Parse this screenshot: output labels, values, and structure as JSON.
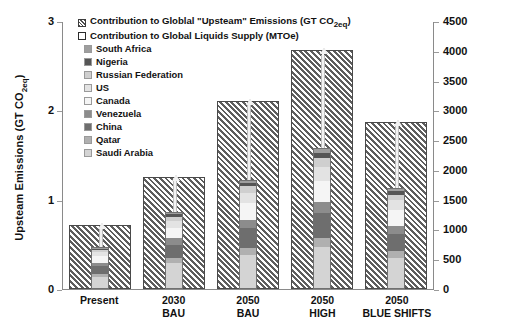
{
  "chart_data": {
    "type": "bar",
    "title": "",
    "subtitle": "",
    "categories": [
      "Present",
      "2030 BAU",
      "2050 BAU",
      "2050 HIGH",
      "2050 BLUE SHIFTS"
    ],
    "category_lines": [
      {
        "line1": "Present",
        "line2": ""
      },
      {
        "line1": "2030",
        "line2": "BAU"
      },
      {
        "line1": "2050",
        "line2": "BAU"
      },
      {
        "line1": "2050",
        "line2": "HIGH"
      },
      {
        "line1": "2050",
        "line2": "BLUE SHIFTS"
      }
    ],
    "xlabel": "",
    "ylabel": "Upsteam Emissions (GT CO2eq)",
    "ylabel_right": "Liquids Supply (MTOe)",
    "ylim": [
      0,
      3
    ],
    "ylim_right": [
      0,
      4500
    ],
    "yticks": [
      0,
      1,
      2,
      3
    ],
    "yticks_right": [
      0,
      500,
      1000,
      1500,
      2000,
      2500,
      3000,
      3500,
      4000,
      4500
    ],
    "grid": false,
    "legend_position": "upper-left",
    "series": [
      {
        "name": "Contribution to Global \"Upsteam\" Emissions (GT CO2eq)",
        "axis": "left",
        "style": "hatched",
        "values": [
          0.72,
          1.25,
          2.1,
          2.67,
          1.87
        ]
      },
      {
        "name": "Contribution to Global Liquids Supply (MTOe)",
        "axis": "right",
        "style": "stacked",
        "total_values": [
          700,
          1290,
          1830,
          2370,
          1700
        ],
        "stack": [
          {
            "name": "Saudi Arabia",
            "color": "#d4d4d4",
            "values": [
              200,
              430,
              560,
              700,
              520
            ]
          },
          {
            "name": "Qatar",
            "color": "#b0b0b0",
            "values": [
              40,
              80,
              120,
              160,
              110
            ]
          },
          {
            "name": "China",
            "color": "#6e6e6e",
            "values": [
              150,
              240,
              340,
              420,
              300
            ]
          },
          {
            "name": "Venezuela",
            "color": "#8c8c8c",
            "values": [
              60,
              110,
              150,
              190,
              140
            ]
          },
          {
            "name": "Canada",
            "color": "#f5f5f5",
            "values": [
              110,
              180,
              280,
              360,
              260
            ]
          },
          {
            "name": "US",
            "color": "#e3e3e3",
            "values": [
              70,
              120,
              180,
              240,
              170
            ]
          },
          {
            "name": "Russian Federation",
            "color": "#cfcfcf",
            "values": [
              40,
              70,
              110,
              140,
              100
            ]
          },
          {
            "name": "Nigeria",
            "color": "#555555",
            "values": [
              20,
              40,
              60,
              90,
              60
            ]
          },
          {
            "name": "South Africa",
            "color": "#9e9e9e",
            "values": [
              10,
              20,
              30,
              70,
              40
            ]
          }
        ]
      }
    ],
    "annotations": [
      {
        "type": "arrow",
        "note": "vertical arrow from stacked bar top to hatched bar top",
        "group": "Present"
      },
      {
        "type": "arrow",
        "note": "vertical arrow from stacked bar top to hatched bar top",
        "group": "2030 BAU"
      },
      {
        "type": "arrow",
        "note": "vertical arrow from stacked bar top to hatched bar top",
        "group": "2050 BAU"
      },
      {
        "type": "arrow",
        "note": "vertical arrow from stacked bar top to hatched bar top",
        "group": "2050 HIGH"
      },
      {
        "type": "arrow",
        "note": "vertical arrow from stacked bar top to hatched bar top",
        "group": "2050 BLUE SHIFTS"
      }
    ]
  },
  "legend": {
    "entries": [
      {
        "label": "Contribution to Globlal \"Upsteam\" Emissions (GT CO2eq)",
        "swatch": "hatched",
        "color": ""
      },
      {
        "label": "Contribution to Global Liquids Supply (MTOe)",
        "swatch": "hollow",
        "color": "#ffffff"
      },
      {
        "label": "South Africa",
        "swatch": "solid",
        "color": "#9e9e9e"
      },
      {
        "label": "Nigeria",
        "swatch": "solid",
        "color": "#555555"
      },
      {
        "label": "Russian Federation",
        "swatch": "solid",
        "color": "#cfcfcf"
      },
      {
        "label": "US",
        "swatch": "solid",
        "color": "#e3e3e3"
      },
      {
        "label": "Canada",
        "swatch": "solid",
        "color": "#f5f5f5"
      },
      {
        "label": "Venezuela",
        "swatch": "solid",
        "color": "#8c8c8c"
      },
      {
        "label": "China",
        "swatch": "solid",
        "color": "#6e6e6e"
      },
      {
        "label": "Qatar",
        "swatch": "solid",
        "color": "#b0b0b0"
      },
      {
        "label": "Saudi Arabia",
        "swatch": "solid",
        "color": "#d4d4d4"
      }
    ]
  },
  "axis_titles": {
    "left_pre": "Upsteam Emissions (GT CO",
    "left_sub": "2eq",
    "left_post": ")",
    "right": "Liquids Supply (MTOe)"
  }
}
